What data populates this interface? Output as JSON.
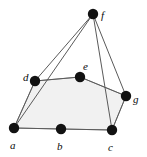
{
  "figure": {
    "type": "undirected-graph-diagram",
    "title": "",
    "background_color": "#ffffff",
    "vertex_color": "#121212",
    "edge_color": "#5a5a5a",
    "label_color": "#0a0a0a",
    "face_fill_color": "#f1f1f1",
    "face_stroke_color": "#8c8c8c",
    "vertex_radius": 5.2,
    "edge_width": 1.0,
    "width": 147,
    "height": 157
  },
  "vertices": [
    {
      "id": "a",
      "label": "a",
      "x": 14,
      "y": 128,
      "label_x": 10,
      "label_y": 140
    },
    {
      "id": "b",
      "label": "b",
      "x": 61,
      "y": 129,
      "label_x": 57,
      "label_y": 141
    },
    {
      "id": "c",
      "label": "c",
      "x": 112,
      "y": 130,
      "label_x": 108,
      "label_y": 142
    },
    {
      "id": "d",
      "label": "d",
      "x": 35,
      "y": 81,
      "label_x": 23,
      "label_y": 72
    },
    {
      "id": "e",
      "label": "e",
      "x": 80,
      "y": 77,
      "label_x": 83,
      "label_y": 61
    },
    {
      "id": "f",
      "label": "f",
      "x": 93,
      "y": 14,
      "label_x": 101,
      "label_y": 10
    },
    {
      "id": "g",
      "label": "g",
      "x": 126,
      "y": 96,
      "label_x": 133,
      "label_y": 94
    }
  ],
  "edges": [
    {
      "from": "a",
      "to": "b"
    },
    {
      "from": "b",
      "to": "c"
    },
    {
      "from": "a",
      "to": "d"
    },
    {
      "from": "d",
      "to": "e"
    },
    {
      "from": "e",
      "to": "g"
    },
    {
      "from": "g",
      "to": "c"
    },
    {
      "from": "a",
      "to": "f"
    },
    {
      "from": "d",
      "to": "f"
    },
    {
      "from": "f",
      "to": "c"
    },
    {
      "from": "f",
      "to": "g"
    }
  ],
  "shaded_face": {
    "name": "inner-face",
    "vertex_ids": [
      "a",
      "d",
      "e",
      "g",
      "c",
      "b"
    ]
  }
}
